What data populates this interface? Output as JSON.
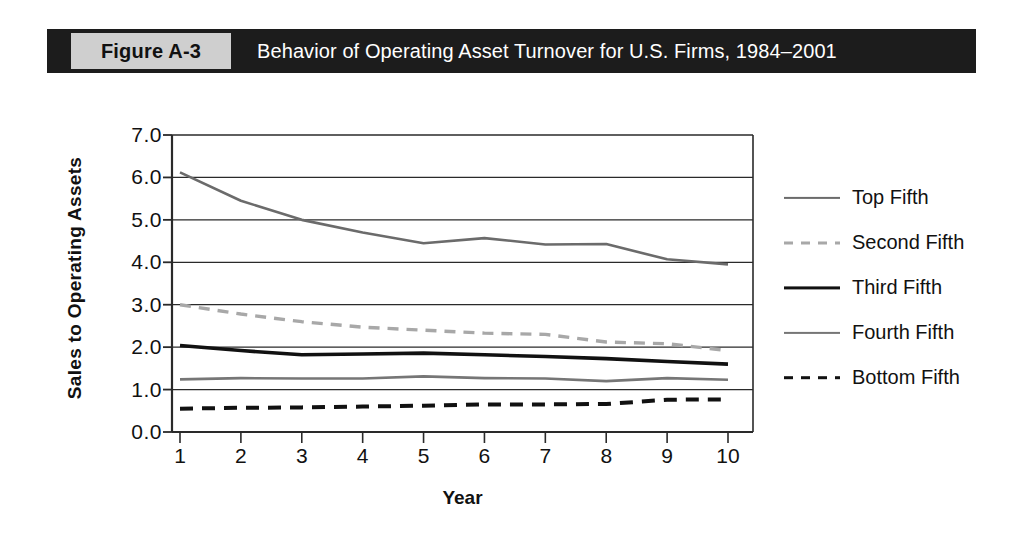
{
  "caption": {
    "figure_tag": "Figure A-3",
    "title": "Behavior of Operating Asset Turnover for U.S. Firms, 1984–2001"
  },
  "chart_data": {
    "type": "line",
    "title": "Behavior of Operating Asset Turnover for U.S. Firms, 1984–2001",
    "xlabel": "Year",
    "ylabel": "Sales to Operating Assets",
    "x": [
      1,
      2,
      3,
      4,
      5,
      6,
      7,
      8,
      9,
      10
    ],
    "xticklabels": [
      "1",
      "2",
      "3",
      "4",
      "5",
      "6",
      "7",
      "8",
      "9",
      "10"
    ],
    "yticklabels": [
      "0.0",
      "1.0",
      "2.0",
      "3.0",
      "4.0",
      "5.0",
      "6.0",
      "7.0"
    ],
    "ylim": [
      0.0,
      7.0
    ],
    "xlim": [
      1,
      10
    ],
    "ytick_step": 1.0,
    "grid": "horizontal",
    "legend_position": "right",
    "series": [
      {
        "name": "Top Fifth",
        "style": "solid",
        "color": "#6b6b6b",
        "width": 2.6,
        "values": [
          6.12,
          5.45,
          5.0,
          4.7,
          4.45,
          4.57,
          4.42,
          4.43,
          4.07,
          3.95
        ]
      },
      {
        "name": "Second Fifth",
        "style": "dashed",
        "color": "#a8a8a8",
        "width": 3.4,
        "values": [
          3.0,
          2.78,
          2.6,
          2.47,
          2.4,
          2.33,
          2.3,
          2.12,
          2.08,
          1.92
        ]
      },
      {
        "name": "Third Fifth",
        "style": "solid",
        "color": "#111111",
        "width": 3.6,
        "values": [
          2.04,
          1.92,
          1.82,
          1.84,
          1.86,
          1.82,
          1.78,
          1.73,
          1.66,
          1.6
        ]
      },
      {
        "name": "Fourth Fifth",
        "style": "solid",
        "color": "#767676",
        "width": 2.6,
        "values": [
          1.24,
          1.27,
          1.26,
          1.26,
          1.31,
          1.27,
          1.26,
          1.2,
          1.27,
          1.23
        ]
      },
      {
        "name": "Bottom Fifth",
        "style": "dashed",
        "color": "#111111",
        "width": 4.0,
        "values": [
          0.55,
          0.57,
          0.58,
          0.6,
          0.62,
          0.65,
          0.65,
          0.66,
          0.76,
          0.77
        ]
      }
    ]
  }
}
